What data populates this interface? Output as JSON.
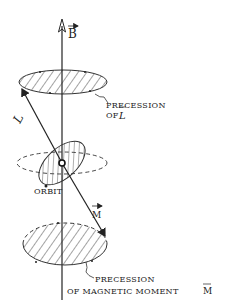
{
  "diagram": {
    "labels": {
      "field": "B",
      "angular_momentum": "L",
      "magnetic_moment": "M",
      "orbit": "ORBIT",
      "precession_L_line1": "PRECESSION",
      "precession_L_line2": "OF",
      "precession_L_symbol": "L",
      "precession_M_line1": "PRECESSION",
      "precession_M_line2": "OF MAGNETIC MOMENT",
      "precession_M_symbol": "M"
    },
    "colors": {
      "ink": "#222222",
      "background": "#ffffff"
    }
  }
}
